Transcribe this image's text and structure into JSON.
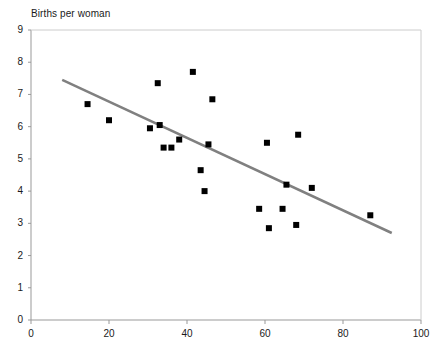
{
  "chart_data": {
    "type": "scatter",
    "title": "",
    "axis_note": "Births per woman",
    "ylabel": "Births per woman",
    "xlabel": "",
    "xlim": [
      0,
      100
    ],
    "ylim": [
      0,
      9
    ],
    "xticks": [
      0,
      20,
      40,
      60,
      80,
      100
    ],
    "yticks": [
      0,
      1,
      2,
      3,
      4,
      5,
      6,
      7,
      8,
      9
    ],
    "grid": false,
    "legend": "none",
    "marker": {
      "shape": "square",
      "color": "#000000",
      "size_px": 6
    },
    "points": [
      {
        "x": 14.5,
        "y": 6.7
      },
      {
        "x": 20.0,
        "y": 6.2
      },
      {
        "x": 30.5,
        "y": 5.95
      },
      {
        "x": 32.5,
        "y": 7.35
      },
      {
        "x": 33.0,
        "y": 6.05
      },
      {
        "x": 34.0,
        "y": 5.35
      },
      {
        "x": 36.0,
        "y": 5.35
      },
      {
        "x": 38.0,
        "y": 5.6
      },
      {
        "x": 41.5,
        "y": 7.7
      },
      {
        "x": 43.5,
        "y": 4.65
      },
      {
        "x": 44.5,
        "y": 4.0
      },
      {
        "x": 45.5,
        "y": 5.45
      },
      {
        "x": 46.5,
        "y": 6.85
      },
      {
        "x": 58.5,
        "y": 3.45
      },
      {
        "x": 60.5,
        "y": 5.5
      },
      {
        "x": 61.0,
        "y": 2.85
      },
      {
        "x": 64.5,
        "y": 3.45
      },
      {
        "x": 65.5,
        "y": 4.2
      },
      {
        "x": 68.0,
        "y": 2.95
      },
      {
        "x": 68.5,
        "y": 5.75
      },
      {
        "x": 72.0,
        "y": 4.1
      },
      {
        "x": 87.0,
        "y": 3.25
      }
    ],
    "trendline": {
      "type": "linear",
      "color": "#808080",
      "width_px": 2.5,
      "x_start": 8.0,
      "y_start": 7.45,
      "x_end": 92.5,
      "y_end": 2.7
    }
  },
  "axis": {
    "y_title": "Births per woman",
    "y_tick_labels": [
      "9",
      "8",
      "7",
      "6",
      "5",
      "4",
      "3",
      "2",
      "1",
      "0"
    ],
    "x_tick_labels": [
      "0",
      "20",
      "40",
      "60",
      "80",
      "100"
    ]
  },
  "colors": {
    "marker": "#000000",
    "trendline": "#808080",
    "axis": "#999999",
    "text": "#1a1a1a",
    "background": "#ffffff"
  }
}
